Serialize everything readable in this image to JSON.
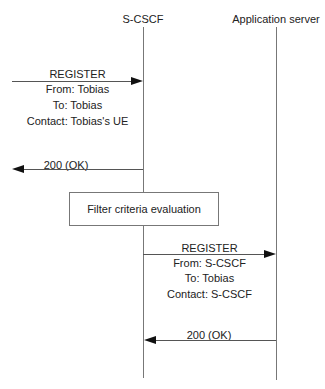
{
  "participants": [
    {
      "name": "S-CSCF"
    },
    {
      "name": "Application server"
    }
  ],
  "messages": [
    {
      "label": "REGISTER",
      "lines": [
        "From: Tobias",
        "To: Tobias",
        "Contact: Tobias's UE"
      ],
      "direction": "right",
      "from": "UE",
      "to": "S-CSCF"
    },
    {
      "label": "200 (OK)",
      "direction": "left",
      "from": "S-CSCF",
      "to": "UE"
    },
    {
      "label": "REGISTER",
      "lines": [
        "From: S-CSCF",
        "To: Tobias",
        "Contact: S-CSCF"
      ],
      "direction": "right",
      "from": "S-CSCF",
      "to": "Application server"
    },
    {
      "label": "200 (OK)",
      "direction": "left",
      "from": "Application server",
      "to": "S-CSCF"
    }
  ],
  "process_box": {
    "label": "Filter criteria evaluation"
  }
}
